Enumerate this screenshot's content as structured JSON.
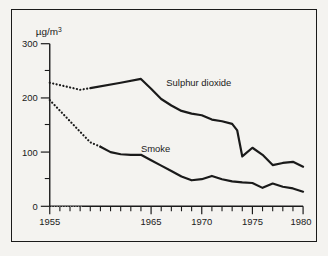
{
  "chart_data": {
    "type": "line",
    "title": "",
    "subtitle": "",
    "xlabel": "",
    "ylabel": "µg/m³",
    "ylabel_base": "µg/m",
    "ylabel_sup": "3",
    "xlim": [
      1955,
      1980
    ],
    "ylim": [
      0,
      300
    ],
    "grid": false,
    "legend_position": "inline-annotation",
    "x_ticks_major": [
      1955,
      1965,
      1970,
      1975,
      1980
    ],
    "x_tick_labels": [
      "1955",
      "1965",
      "1970",
      "1975",
      "1980"
    ],
    "x_ticks_minor_step": 1,
    "y_ticks_major": [
      0,
      100,
      200,
      300
    ],
    "y_tick_labels": [
      "0",
      "100",
      "200",
      "300"
    ],
    "y_ticks_minor": [
      50,
      150,
      250
    ],
    "x": [
      1955,
      1956,
      1957,
      1958,
      1959,
      1960,
      1961,
      1962,
      1963,
      1964,
      1965,
      1966,
      1967,
      1968,
      1969,
      1970,
      1971,
      1972,
      1973,
      1974,
      1975,
      1976,
      1977,
      1978,
      1979,
      1980
    ],
    "series": [
      {
        "name": "Sulphur dioxide",
        "label": "Sulphur dioxide",
        "style": "solid-with-dotted-start",
        "dotted_until": 1958,
        "values": [
          228,
          224,
          220,
          215,
          219,
          224,
          228,
          231,
          233,
          235,
          215,
          196,
          182,
          172,
          168,
          166,
          163,
          156,
          152,
          140,
          136,
          127,
          125,
          92,
          108,
          100
        ]
      },
      {
        "name": "Smoke",
        "label": "Smoke",
        "style": "solid-with-dotted-start",
        "dotted_until": 1959,
        "values": [
          196,
          168,
          148,
          132,
          118,
          113,
          103,
          96,
          95,
          95,
          85,
          77,
          70,
          63,
          55,
          48,
          44,
          53,
          48,
          46,
          44,
          44,
          42,
          31,
          41,
          37
        ]
      }
    ],
    "series_so2_points": [
      [
        1955,
        228
      ],
      [
        1958,
        215
      ],
      [
        1959,
        218
      ],
      [
        1962,
        228
      ],
      [
        1964,
        235
      ],
      [
        1965,
        217
      ],
      [
        1966,
        198
      ],
      [
        1967,
        186
      ],
      [
        1968,
        176
      ],
      [
        1969,
        171
      ],
      [
        1970,
        168
      ],
      [
        1971,
        160
      ],
      [
        1972,
        157
      ],
      [
        1973,
        152
      ],
      [
        1973.5,
        140
      ],
      [
        1974,
        92
      ],
      [
        1975,
        108
      ],
      [
        1976,
        95
      ],
      [
        1977,
        76
      ],
      [
        1978,
        80
      ],
      [
        1979,
        82
      ],
      [
        1980,
        73
      ]
    ],
    "series_smoke_points": [
      [
        1955,
        196
      ],
      [
        1959,
        118
      ],
      [
        1960,
        110
      ],
      [
        1961,
        100
      ],
      [
        1962,
        96
      ],
      [
        1963,
        95
      ],
      [
        1964,
        95
      ],
      [
        1965,
        85
      ],
      [
        1966,
        75
      ],
      [
        1967,
        65
      ],
      [
        1968,
        55
      ],
      [
        1969,
        48
      ],
      [
        1970,
        50
      ],
      [
        1971,
        56
      ],
      [
        1972,
        50
      ],
      [
        1973,
        46
      ],
      [
        1974,
        44
      ],
      [
        1975,
        43
      ],
      [
        1976,
        34
      ],
      [
        1977,
        42
      ],
      [
        1978,
        36
      ],
      [
        1979,
        33
      ],
      [
        1980,
        27
      ]
    ],
    "annotations": [
      {
        "text": "Sulphur dioxide",
        "x": 1966.5,
        "y": 222
      },
      {
        "text": "Smoke",
        "x": 1964.0,
        "y": 100
      }
    ],
    "colors": {
      "line": "#1a1a1a",
      "axis": "#1a1a1a",
      "background": "#f4f3f0",
      "border": "#1a1a1a",
      "baseline_dotted": "#8a8a8a"
    }
  }
}
